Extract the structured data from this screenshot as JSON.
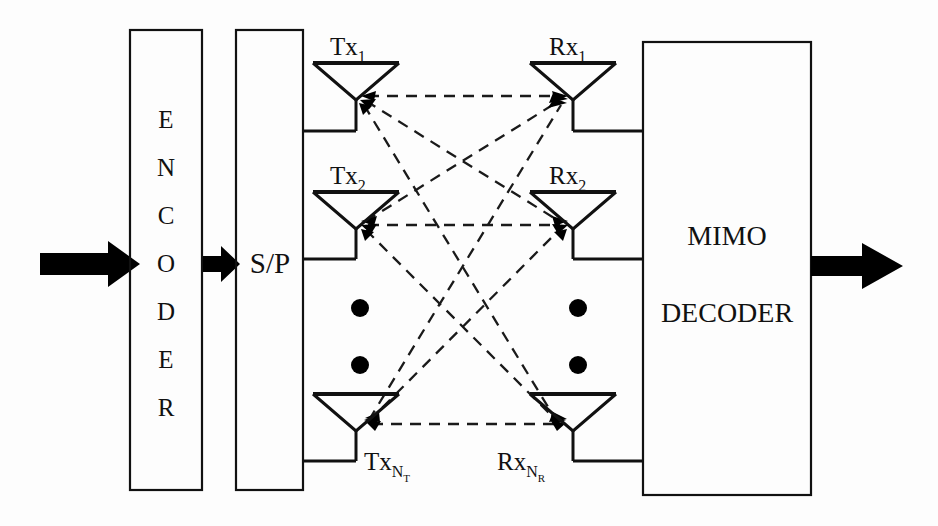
{
  "figure": {
    "kind": "mimo-system-block-diagram",
    "background_color": "#fdfdfd",
    "line_color": "#111111"
  },
  "encoder": {
    "label": "ENCODER",
    "letters": [
      "E",
      "N",
      "C",
      "O",
      "D",
      "E",
      "R"
    ]
  },
  "serial_parallel": {
    "label": "S/P"
  },
  "decoder": {
    "line1": "MIMO",
    "line2": "DECODER"
  },
  "transmit": {
    "antennas": [
      {
        "base": "Tx",
        "sub": "1",
        "subsub": ""
      },
      {
        "base": "Tx",
        "sub": "2",
        "subsub": ""
      },
      {
        "base": "Tx",
        "sub": "N",
        "subsub": "T"
      }
    ]
  },
  "receive": {
    "antennas": [
      {
        "base": "Rx",
        "sub": "1",
        "subsub": ""
      },
      {
        "base": "Rx",
        "sub": "2",
        "subsub": ""
      },
      {
        "base": "Rx",
        "sub": "N",
        "subsub": "R"
      }
    ]
  },
  "ellipsis": {
    "tx_dots": 2,
    "rx_dots": 2
  },
  "channel": {
    "style": "dashed",
    "arrowheads": "both-ends",
    "description": "full mesh between every Tx and every Rx"
  },
  "flow": {
    "input_arrow": "input-signal-arrow",
    "mid_arrow": "encoder-to-sp-arrow",
    "output_arrow": "output-signal-arrow"
  }
}
